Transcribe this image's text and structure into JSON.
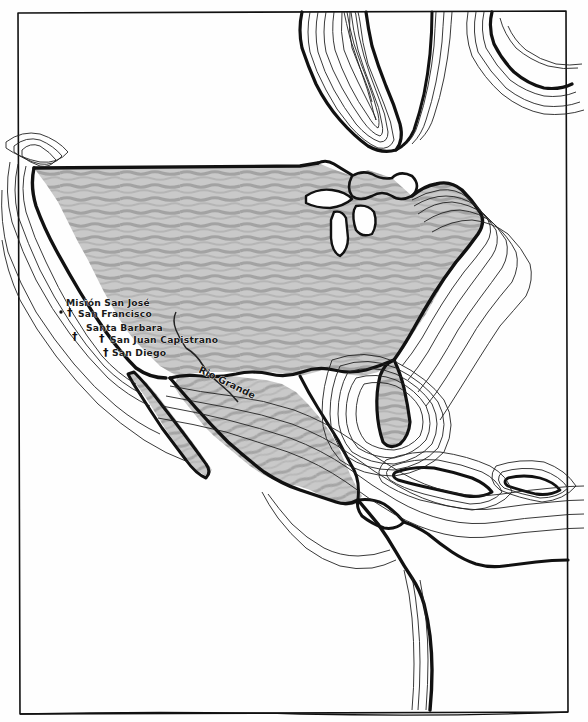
{
  "map": {
    "title": "Hand-drawn map of North America",
    "frame": {
      "style": "hand-drawn ink rectangle",
      "color": "#111111"
    },
    "background_color": "#fefefe",
    "land_fill_color": "#c8c8c8",
    "land_hatch_color": "#9a9a9a",
    "coastline_color": "#111111",
    "contour_color": "#222222",
    "regions": [
      {
        "name": "united-states",
        "shaded": true,
        "note": "pencil-hatched territory"
      },
      {
        "name": "mexico",
        "shaded": true,
        "note": "pencil-hatched territory"
      },
      {
        "name": "baja-california",
        "shaded": true
      },
      {
        "name": "florida",
        "shaded": true
      },
      {
        "name": "canada",
        "shaded": false
      },
      {
        "name": "central-america",
        "shaded": false
      },
      {
        "name": "cuba",
        "shaded": false
      },
      {
        "name": "hispaniola",
        "shaded": false
      },
      {
        "name": "south-america",
        "shaded": false
      },
      {
        "name": "great-lakes",
        "shaded": false
      }
    ],
    "mission_labels": [
      {
        "id": "mision-san-jose",
        "text": "Misión San José",
        "x": 66,
        "y": 302,
        "marker": "none"
      },
      {
        "id": "san-francisco",
        "text": "San Francisco",
        "x": 78,
        "y": 313,
        "marker": "cross"
      },
      {
        "id": "santa-barbara",
        "text": "Santa Barbara",
        "x": 86,
        "y": 327,
        "marker": "cross"
      },
      {
        "id": "san-juan-capistrano",
        "text": "San Juan Capistrano",
        "x": 110,
        "y": 340,
        "marker": "cross"
      },
      {
        "id": "san-diego",
        "text": "San Diego",
        "x": 112,
        "y": 353,
        "marker": "cross"
      }
    ],
    "marker_symbol": "†",
    "river_labels": [
      {
        "id": "rio-grande",
        "text": "Rio Grande",
        "x": 198,
        "y": 372
      }
    ]
  }
}
